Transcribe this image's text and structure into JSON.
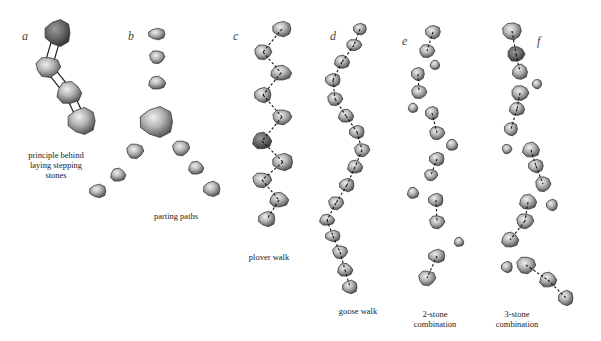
{
  "figure": {
    "background": "#ffffff",
    "stone_colors": {
      "light": "#d8d8d8",
      "mid": "#9a9a9a",
      "dark": "#4a4a4a",
      "outline": "#3a3a3a"
    },
    "panels": [
      {
        "id": "a",
        "letter": "a",
        "letter_pos": [
          22,
          37
        ],
        "caption": [
          "principle behind",
          "laying stepping",
          "stones"
        ],
        "caption_pos": [
          55,
          150
        ],
        "link_style": "double",
        "stones": [
          [
            58,
            33,
            14,
            14,
            "dark"
          ],
          [
            48,
            67,
            13,
            11,
            "mid"
          ],
          [
            69,
            93,
            13,
            12,
            "mid"
          ],
          [
            82,
            121,
            15,
            14,
            "mid"
          ]
        ],
        "links": [
          [
            0,
            1
          ],
          [
            1,
            2
          ],
          [
            2,
            3
          ]
        ]
      },
      {
        "id": "b",
        "letter": "b",
        "letter_pos": [
          128,
          37
        ],
        "caption": [
          "parting paths"
        ],
        "caption_pos": [
          176,
          215
        ],
        "link_style": "none",
        "stones": [
          [
            157,
            34,
            9,
            6,
            "mid"
          ],
          [
            157,
            57,
            8,
            7,
            "mid"
          ],
          [
            157,
            83,
            9,
            7,
            "mid"
          ],
          [
            157,
            122,
            18,
            16,
            "mid"
          ],
          [
            135,
            151,
            9,
            8,
            "mid"
          ],
          [
            118,
            175,
            8,
            7,
            "mid"
          ],
          [
            98,
            191,
            9,
            7,
            "mid"
          ],
          [
            181,
            148,
            9,
            8,
            "mid"
          ],
          [
            196,
            168,
            8,
            7,
            "mid"
          ],
          [
            212,
            189,
            9,
            8,
            "mid"
          ]
        ],
        "links": []
      },
      {
        "id": "c",
        "letter": "c",
        "letter_pos": [
          233,
          37
        ],
        "caption": [
          "plover walk"
        ],
        "caption_pos": [
          269,
          255
        ],
        "link_style": "dashed",
        "stones": [
          [
            282,
            29,
            10,
            8,
            "mid"
          ],
          [
            263,
            52,
            9,
            8,
            "mid"
          ],
          [
            281,
            73,
            11,
            8,
            "mid"
          ],
          [
            263,
            95,
            9,
            8,
            "mid"
          ],
          [
            282,
            117,
            10,
            8,
            "mid"
          ],
          [
            262,
            141,
            10,
            9,
            "dark"
          ],
          [
            283,
            162,
            11,
            9,
            "mid"
          ],
          [
            262,
            180,
            10,
            8,
            "mid"
          ],
          [
            279,
            200,
            10,
            8,
            "mid"
          ],
          [
            267,
            219,
            9,
            8,
            "mid"
          ]
        ],
        "links": [
          [
            0,
            1
          ],
          [
            1,
            2
          ],
          [
            2,
            3
          ],
          [
            3,
            4
          ],
          [
            4,
            5
          ],
          [
            5,
            6
          ],
          [
            6,
            7
          ],
          [
            7,
            8
          ],
          [
            8,
            9
          ]
        ]
      },
      {
        "id": "d",
        "letter": "d",
        "letter_pos": [
          330,
          37
        ],
        "caption": [
          "goose walk"
        ],
        "caption_pos": [
          358,
          305
        ],
        "link_style": "dashed",
        "stones": [
          [
            360,
            29,
            7,
            6,
            "mid"
          ],
          [
            354,
            45,
            8,
            6,
            "mid"
          ],
          [
            342,
            62,
            8,
            7,
            "mid"
          ],
          [
            333,
            80,
            8,
            7,
            "mid"
          ],
          [
            335,
            99,
            8,
            7,
            "mid"
          ],
          [
            346,
            116,
            8,
            7,
            "mid"
          ],
          [
            357,
            132,
            8,
            7,
            "mid"
          ],
          [
            362,
            150,
            8,
            7,
            "mid"
          ],
          [
            355,
            167,
            8,
            7,
            "mid"
          ],
          [
            347,
            185,
            8,
            7,
            "mid"
          ],
          [
            336,
            203,
            8,
            7,
            "mid"
          ],
          [
            327,
            220,
            8,
            6,
            "mid"
          ],
          [
            333,
            236,
            8,
            6,
            "mid"
          ],
          [
            340,
            252,
            8,
            7,
            "mid"
          ],
          [
            345,
            270,
            8,
            7,
            "mid"
          ],
          [
            350,
            287,
            8,
            7,
            "mid"
          ]
        ],
        "links": [
          [
            0,
            1
          ],
          [
            1,
            2
          ],
          [
            2,
            3
          ],
          [
            3,
            4
          ],
          [
            4,
            5
          ],
          [
            5,
            6
          ],
          [
            6,
            7
          ],
          [
            7,
            8
          ],
          [
            8,
            9
          ],
          [
            9,
            10
          ],
          [
            10,
            11
          ],
          [
            11,
            12
          ],
          [
            12,
            13
          ],
          [
            13,
            14
          ],
          [
            14,
            15
          ]
        ]
      },
      {
        "id": "e",
        "letter": "e",
        "letter_pos": [
          402,
          42
        ],
        "caption": [
          "2-stone",
          "combination"
        ],
        "caption_pos": [
          435,
          313
        ],
        "link_style": "dashed",
        "stones": [
          [
            433,
            32,
            8,
            7,
            "mid"
          ],
          [
            427,
            51,
            8,
            7,
            "mid"
          ],
          [
            435,
            65,
            5,
            5,
            "mid"
          ],
          [
            418,
            74,
            7,
            7,
            "mid"
          ],
          [
            419,
            92,
            8,
            7,
            "mid"
          ],
          [
            413,
            108,
            5,
            5,
            "mid"
          ],
          [
            432,
            113,
            7,
            7,
            "mid"
          ],
          [
            437,
            133,
            8,
            7,
            "mid"
          ],
          [
            452,
            145,
            6,
            6,
            "mid"
          ],
          [
            437,
            159,
            8,
            7,
            "mid"
          ],
          [
            431,
            175,
            7,
            6,
            "mid"
          ],
          [
            413,
            193,
            6,
            6,
            "mid"
          ],
          [
            436,
            200,
            8,
            7,
            "mid"
          ],
          [
            437,
            222,
            8,
            7,
            "mid"
          ],
          [
            459,
            242,
            5,
            5,
            "mid"
          ],
          [
            437,
            256,
            9,
            7,
            "mid"
          ],
          [
            427,
            278,
            9,
            8,
            "mid"
          ]
        ],
        "links": [
          [
            0,
            1
          ],
          [
            3,
            4
          ],
          [
            6,
            7
          ],
          [
            9,
            10
          ],
          [
            12,
            13
          ],
          [
            15,
            16
          ]
        ]
      },
      {
        "id": "f",
        "letter": "f",
        "letter_pos": [
          538,
          42
        ],
        "caption": [
          "3-stone",
          "combination"
        ],
        "caption_pos": [
          517,
          313
        ],
        "link_style": "dashed",
        "stones": [
          [
            512,
            31,
            10,
            9,
            "mid"
          ],
          [
            516,
            54,
            9,
            8,
            "dark"
          ],
          [
            520,
            72,
            8,
            8,
            "mid"
          ],
          [
            537,
            84,
            5,
            5,
            "mid"
          ],
          [
            520,
            93,
            9,
            8,
            "mid"
          ],
          [
            517,
            109,
            8,
            7,
            "mid"
          ],
          [
            511,
            129,
            7,
            7,
            "mid"
          ],
          [
            507,
            149,
            5,
            5,
            "mid"
          ],
          [
            531,
            150,
            9,
            8,
            "mid"
          ],
          [
            536,
            166,
            8,
            7,
            "mid"
          ],
          [
            543,
            184,
            8,
            8,
            "mid"
          ],
          [
            528,
            202,
            9,
            8,
            "mid"
          ],
          [
            552,
            205,
            6,
            6,
            "mid"
          ],
          [
            525,
            221,
            9,
            8,
            "mid"
          ],
          [
            510,
            240,
            9,
            8,
            "mid"
          ],
          [
            507,
            267,
            6,
            6,
            "mid"
          ],
          [
            526,
            265,
            10,
            9,
            "mid"
          ],
          [
            548,
            280,
            9,
            8,
            "mid"
          ],
          [
            566,
            298,
            8,
            8,
            "mid"
          ]
        ],
        "links": [
          [
            0,
            1
          ],
          [
            1,
            2
          ],
          [
            4,
            5
          ],
          [
            5,
            6
          ],
          [
            8,
            9
          ],
          [
            9,
            10
          ],
          [
            11,
            13
          ],
          [
            13,
            14
          ],
          [
            16,
            17
          ],
          [
            17,
            18
          ]
        ]
      }
    ]
  }
}
